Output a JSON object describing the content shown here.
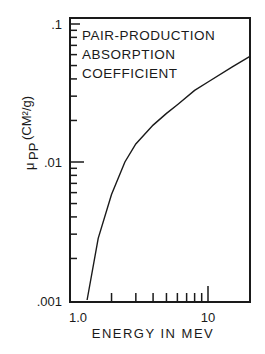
{
  "chart_data": {
    "type": "line",
    "title": [
      "PAIR-PRODUCTION",
      "ABSORPTION",
      "COEFFICIENT"
    ],
    "xlabel": "ENERGY IN MEV",
    "ylabel": "μpp (cm²/g)",
    "ylabel_main": "μ",
    "ylabel_sub": "PP",
    "ylabel_units": "(CM²/g)",
    "xscale": "log",
    "yscale": "log",
    "xlim": [
      1.0,
      20
    ],
    "ylim": [
      0.001,
      0.1
    ],
    "x_tick_labels": [
      "1.0",
      "10"
    ],
    "y_tick_labels": [
      ".1",
      ".01",
      ".001"
    ],
    "series": [
      {
        "name": "Pair-production absorption coefficient",
        "x": [
          1.33,
          1.6,
          2.0,
          2.5,
          3.0,
          4.0,
          5.0,
          6.0,
          8.0,
          10.0,
          15.0,
          20.0
        ],
        "y": [
          0.001,
          0.0028,
          0.0058,
          0.01,
          0.0135,
          0.0185,
          0.0225,
          0.026,
          0.033,
          0.038,
          0.049,
          0.058
        ]
      }
    ],
    "grid": false,
    "legend": "none"
  }
}
